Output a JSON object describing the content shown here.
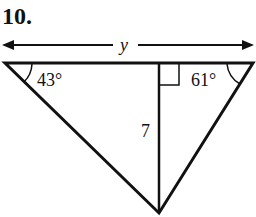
{
  "problem": {
    "number": "10.",
    "width_label": "y",
    "angle_left": "43°",
    "angle_right": "61°",
    "altitude_label": "7"
  },
  "geometry": {
    "top_left": [
      5,
      63
    ],
    "top_right": [
      253,
      63
    ],
    "bottom_vertex": [
      159,
      213
    ],
    "altitude_foot": [
      159,
      63
    ],
    "right_angle_mark": true
  },
  "colors": {
    "stroke": "#111111",
    "background": "#ffffff"
  }
}
